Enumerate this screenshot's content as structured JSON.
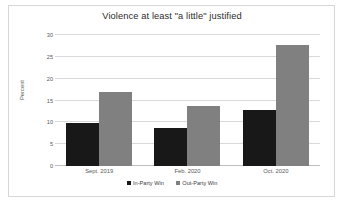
{
  "chart_data": {
    "type": "bar",
    "title": "Violence at least \"a little\" justified",
    "xlabel": "",
    "ylabel": "Percent",
    "categories": [
      "Sept. 2019",
      "Feb. 2020",
      "Oct. 2020"
    ],
    "series": [
      {
        "name": "In-Party Win",
        "color": "#181818",
        "values": [
          9.8,
          8.7,
          12.8
        ]
      },
      {
        "name": "Out-Party Win",
        "color": "#808080",
        "values": [
          16.9,
          13.8,
          27.6
        ]
      }
    ],
    "ylim": [
      0,
      30
    ],
    "yticks": [
      0,
      5,
      10,
      15,
      20,
      25,
      30
    ],
    "ytick_labels": [
      "0",
      "5",
      "10",
      "15",
      "20",
      "25",
      "30"
    ],
    "grid": true,
    "legend_position": "bottom"
  },
  "figure": {
    "border_color": "#d6d6d6",
    "background": "#ffffff",
    "gridline_color": "#d9d9d9"
  }
}
